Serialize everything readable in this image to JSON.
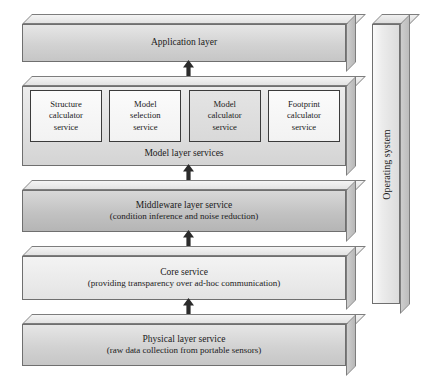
{
  "figure": {
    "type": "layered-architecture-diagram",
    "orientation": "bottom-up stack with side bar",
    "background_color": "#ffffff"
  },
  "layers": [
    {
      "id": "application",
      "title": "Application layer",
      "subtitle": "",
      "shade": "mid"
    },
    {
      "id": "model",
      "title": "",
      "caption": "Model layer services",
      "shade": "model"
    },
    {
      "id": "middleware",
      "title": "Middleware layer service",
      "subtitle": "(condition inference and noise reduction)",
      "shade": "dark"
    },
    {
      "id": "core",
      "title": "Core service",
      "subtitle": "(providing transparency over ad-hoc communication)",
      "shade": "light"
    },
    {
      "id": "physical",
      "title": "Physical layer service",
      "subtitle": "(raw data collection from portable sensors)",
      "shade": "mid"
    }
  ],
  "model_services": [
    {
      "line1": "Structure",
      "line2": "calculator",
      "line3": "service",
      "shaded": false
    },
    {
      "line1": "Model",
      "line2": "selection",
      "line3": "service",
      "shaded": false
    },
    {
      "line1": "Model",
      "line2": "calculator",
      "line3": "service",
      "shaded": true
    },
    {
      "line1": "Footprint",
      "line2": "calculator",
      "line3": "service",
      "shaded": false
    }
  ],
  "side_bar": {
    "label": "Operating system",
    "text_rotation": "-90deg"
  },
  "arrows": [
    {
      "id": "model-to-application",
      "direction": "up"
    },
    {
      "id": "middleware-to-model",
      "direction": "up"
    },
    {
      "id": "core-to-middleware",
      "direction": "up"
    },
    {
      "id": "physical-to-core",
      "direction": "up"
    }
  ],
  "colors": {
    "outline": "#6f6f6f",
    "box_outline": "#3b3b3b",
    "arrow": "#2b2b2b",
    "text": "#1a1a1a"
  }
}
